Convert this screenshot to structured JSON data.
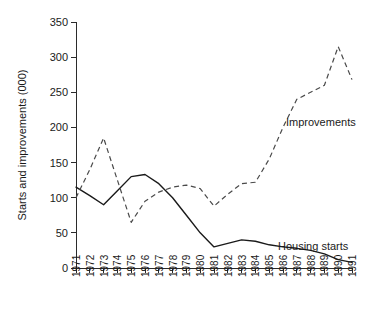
{
  "chart_data": {
    "type": "line",
    "title": "",
    "xlabel": "",
    "ylabel": "Starts and improvements (000)",
    "ylim": [
      0,
      350
    ],
    "yticks": [
      0,
      50,
      100,
      150,
      200,
      250,
      300,
      350
    ],
    "grid": false,
    "legend_position": "inline-annotations",
    "categories": [
      "1971",
      "1972",
      "1973",
      "1974",
      "1975",
      "1976",
      "1977",
      "1978",
      "1979",
      "1980",
      "1981",
      "1982",
      "1983",
      "1984",
      "1985",
      "1986",
      "1987",
      "1988",
      "1989",
      "1990",
      "1991"
    ],
    "series": [
      {
        "name": "Housing starts",
        "style": "solid",
        "label_text": "Housing starts",
        "values": [
          115,
          103,
          90,
          110,
          130,
          133,
          120,
          100,
          75,
          50,
          30,
          35,
          40,
          38,
          33,
          30,
          28,
          25,
          20,
          12,
          8
        ]
      },
      {
        "name": "Improvements",
        "style": "dashed",
        "label_text": "Improvements",
        "values": [
          100,
          140,
          185,
          125,
          65,
          95,
          108,
          115,
          118,
          113,
          88,
          105,
          120,
          122,
          155,
          200,
          240,
          250,
          260,
          315,
          268
        ]
      }
    ]
  },
  "axes": {
    "y_title": "Starts and improvements (000)",
    "y_tick_labels": [
      "0",
      "50",
      "100",
      "150",
      "200",
      "250",
      "300",
      "350"
    ],
    "x_tick_labels": [
      "1971",
      "1972",
      "1973",
      "1974",
      "1975",
      "1976",
      "1977",
      "1978",
      "1979",
      "1980",
      "1981",
      "1982",
      "1983",
      "1984",
      "1985",
      "1986",
      "1987",
      "1988",
      "1989",
      "1990",
      "1991"
    ]
  },
  "annotations": {
    "improvements_label": "Improvements",
    "housing_starts_label": "Housing starts"
  },
  "colors": {
    "solid_series": "#1a1a1a",
    "dashed_series": "#4a4a4a",
    "axis": "#2b2b2b",
    "background": "#ffffff"
  }
}
